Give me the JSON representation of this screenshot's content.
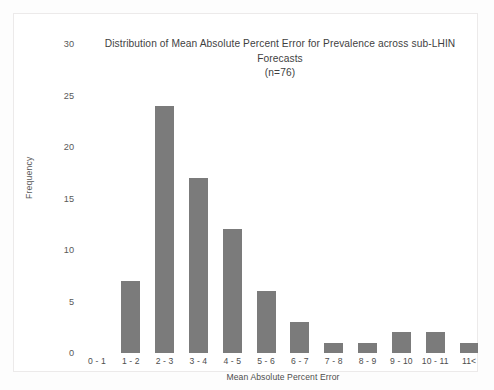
{
  "chart_data": {
    "type": "bar",
    "title": "Distribution of Mean Absolute Percent Error for Prevalence across sub-LHIN Forecasts (n=76)",
    "title_lines": [
      "Distribution of Mean Absolute Percent Error for Prevalence across sub-LHIN",
      "Forecasts",
      "(n=76)"
    ],
    "xlabel": "Mean Absolute Percent Error",
    "ylabel": "Frequency",
    "categories": [
      "0 - 1",
      "1 - 2",
      "2 - 3",
      "3 - 4",
      "4 - 5",
      "5 - 6",
      "6 - 7",
      "7 - 8",
      "8 - 9",
      "9 - 10",
      "10 - 11",
      "11<"
    ],
    "values": [
      0,
      7,
      24,
      17,
      12,
      6,
      3,
      1,
      1,
      2,
      2,
      1
    ],
    "ylim": [
      0,
      30
    ],
    "yticks": [
      0,
      5,
      10,
      15,
      20,
      25,
      30
    ],
    "ytick_labels": [
      "0",
      "5",
      "10",
      "15",
      "20",
      "25",
      "30"
    ],
    "grid": false,
    "legend": false,
    "bar_color": "#7b7b7b",
    "background_color": "#ffffff",
    "sample_size": 76
  }
}
